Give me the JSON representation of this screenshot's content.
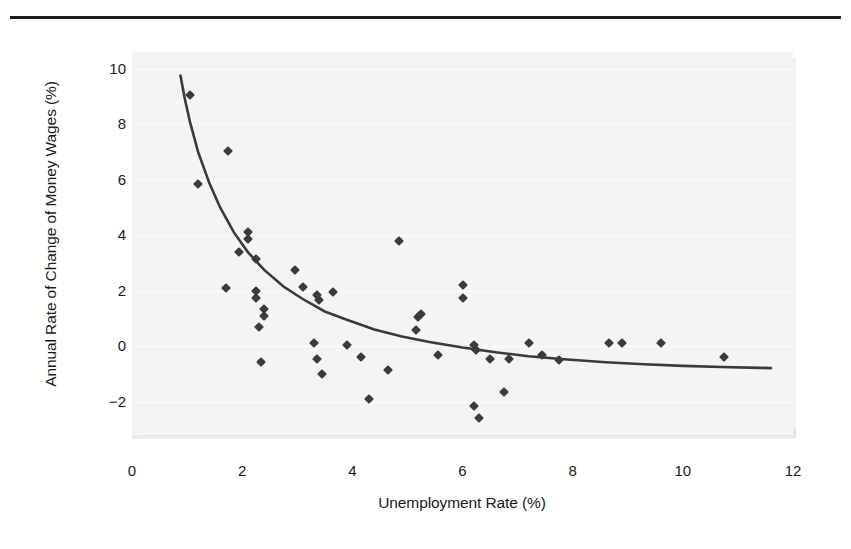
{
  "figure": {
    "background_color": "#ffffff",
    "plot_background_color": "#f4f4f4",
    "rule_color": "#1d1d1d",
    "marker_color": "#3b3b3b",
    "curve_color": "#3a3a3a"
  },
  "chart_data": {
    "type": "scatter",
    "title": "",
    "xlabel": "Unemployment Rate (%)",
    "ylabel": "Annual Rate of Change of Money Wages (%)",
    "xlim": [
      0,
      12
    ],
    "ylim": [
      -3.2,
      10.6
    ],
    "xticks": [
      0,
      2,
      4,
      6,
      8,
      10,
      12
    ],
    "xtick_labels": [
      "0",
      "2",
      "4",
      "6",
      "8",
      "10",
      "12"
    ],
    "yticks": [
      -2,
      0,
      2,
      4,
      6,
      8,
      10
    ],
    "ytick_labels": [
      "−2",
      "0",
      "2",
      "4",
      "6",
      "8",
      "10"
    ],
    "grid": "horizontal",
    "legend": null,
    "points": [
      {
        "x": 1.05,
        "y": 9.05
      },
      {
        "x": 1.2,
        "y": 5.85
      },
      {
        "x": 1.75,
        "y": 7.05
      },
      {
        "x": 2.1,
        "y": 4.1
      },
      {
        "x": 2.1,
        "y": 3.85
      },
      {
        "x": 1.95,
        "y": 3.4
      },
      {
        "x": 2.25,
        "y": 3.15
      },
      {
        "x": 1.7,
        "y": 2.1
      },
      {
        "x": 2.25,
        "y": 2.0
      },
      {
        "x": 2.25,
        "y": 1.75
      },
      {
        "x": 2.4,
        "y": 1.35
      },
      {
        "x": 2.4,
        "y": 1.1
      },
      {
        "x": 2.3,
        "y": 0.7
      },
      {
        "x": 2.35,
        "y": -0.55
      },
      {
        "x": 2.95,
        "y": 2.75
      },
      {
        "x": 3.1,
        "y": 2.15
      },
      {
        "x": 3.35,
        "y": 1.85
      },
      {
        "x": 3.4,
        "y": 1.65
      },
      {
        "x": 3.3,
        "y": 0.1
      },
      {
        "x": 3.35,
        "y": -0.45
      },
      {
        "x": 3.45,
        "y": -1.0
      },
      {
        "x": 3.65,
        "y": 1.95
      },
      {
        "x": 3.9,
        "y": 0.05
      },
      {
        "x": 4.15,
        "y": -0.4
      },
      {
        "x": 4.3,
        "y": -1.9
      },
      {
        "x": 4.65,
        "y": -0.85
      },
      {
        "x": 4.85,
        "y": 3.8
      },
      {
        "x": 5.15,
        "y": 0.6
      },
      {
        "x": 5.25,
        "y": 1.15
      },
      {
        "x": 5.2,
        "y": 1.05
      },
      {
        "x": 5.55,
        "y": -0.3
      },
      {
        "x": 6.0,
        "y": 2.2
      },
      {
        "x": 6.0,
        "y": 1.75
      },
      {
        "x": 6.2,
        "y": 0.05
      },
      {
        "x": 6.25,
        "y": -0.15
      },
      {
        "x": 6.2,
        "y": -2.15
      },
      {
        "x": 6.3,
        "y": -2.6
      },
      {
        "x": 6.5,
        "y": -0.45
      },
      {
        "x": 6.85,
        "y": -0.45
      },
      {
        "x": 6.75,
        "y": -1.65
      },
      {
        "x": 7.2,
        "y": 0.1
      },
      {
        "x": 7.45,
        "y": -0.3
      },
      {
        "x": 7.75,
        "y": -0.5
      },
      {
        "x": 8.65,
        "y": 0.1
      },
      {
        "x": 8.9,
        "y": 0.1
      },
      {
        "x": 9.6,
        "y": 0.1
      },
      {
        "x": 10.75,
        "y": -0.4
      }
    ],
    "fitted_curve": {
      "name": "Phillips curve",
      "x": [
        0.88,
        0.95,
        1.05,
        1.2,
        1.4,
        1.6,
        1.85,
        2.1,
        2.4,
        2.75,
        3.1,
        3.5,
        3.9,
        4.4,
        4.9,
        5.4,
        6.0,
        6.6,
        7.2,
        7.9,
        8.6,
        9.3,
        10.0,
        10.7,
        11.4,
        11.6
      ],
      "y": [
        9.75,
        9.0,
        8.1,
        7.0,
        5.9,
        5.0,
        4.1,
        3.4,
        2.75,
        2.15,
        1.7,
        1.25,
        0.95,
        0.6,
        0.35,
        0.15,
        -0.05,
        -0.22,
        -0.36,
        -0.48,
        -0.58,
        -0.65,
        -0.71,
        -0.75,
        -0.78,
        -0.79
      ]
    }
  }
}
